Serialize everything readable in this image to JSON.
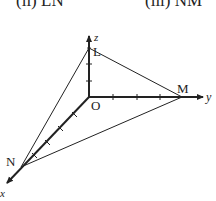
{
  "header": {
    "part_ii": "(ii)  LN",
    "part_iii": "(iii)  NM"
  },
  "diagram": {
    "axes": {
      "x": "x",
      "y": "y",
      "z": "z"
    },
    "points": {
      "origin": "O",
      "L": "L",
      "M": "M",
      "N": "N"
    },
    "segments": [
      "LM",
      "LN",
      "NM"
    ],
    "colors": {
      "line": "#222222",
      "background": "#ffffff"
    }
  }
}
